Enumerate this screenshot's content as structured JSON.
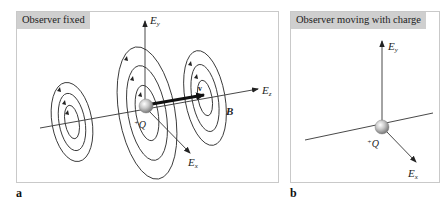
{
  "figure": {
    "panel_a": {
      "letter": "a",
      "title": "Observer fixed",
      "labels": {
        "ey": "E",
        "ey_sub": "y",
        "ez": "E",
        "ez_sub": "z",
        "ex": "E",
        "ex_sub": "x",
        "charge": "Q",
        "charge_sign": "+",
        "velocity": "v",
        "magnetic_field": "B"
      }
    },
    "panel_b": {
      "letter": "b",
      "title": "Observer moving with charge",
      "labels": {
        "ey": "E",
        "ey_sub": "y",
        "ex": "E",
        "ex_sub": "x",
        "charge": "Q",
        "charge_sign": "+"
      }
    },
    "colors": {
      "label_box": "#cfcfcf",
      "border": "#c9c9c9",
      "line": "#333333",
      "charge_sphere": "#b8b8b8"
    }
  }
}
